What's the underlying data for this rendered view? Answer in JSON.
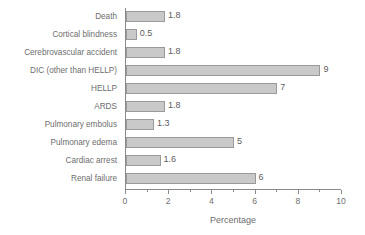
{
  "chart_data": {
    "type": "bar",
    "orientation": "horizontal",
    "title": "",
    "xlabel": "Percentage",
    "ylabel": "",
    "xlim": [
      0,
      10
    ],
    "xticks": [
      0,
      2,
      4,
      6,
      8,
      10
    ],
    "xtick_labels": [
      "0",
      "2",
      "4",
      "6",
      "8",
      "10"
    ],
    "grid": false,
    "legend": null,
    "categories": [
      "Death",
      "Cortical blindness",
      "Cerebrovascular accident",
      "DIC (other than HELLP)",
      "HELLP",
      "ARDS",
      "Pulmonary embolus",
      "Pulmonary edema",
      "Cardiac arrest",
      "Renal failure"
    ],
    "values": [
      1.8,
      0.5,
      1.8,
      9,
      7,
      1.8,
      1.3,
      5,
      1.6,
      6
    ],
    "value_labels": [
      "1.8",
      "0.5",
      "1.8",
      "9",
      "7",
      "1.8",
      "1.3",
      "5",
      "1.6",
      "6"
    ],
    "bar_color": "#c9c9c9",
    "bar_border_color": "#9a9a9a",
    "axis_color": "#8a8a8a",
    "text_color": "#6e6e6e",
    "background": "#ffffff"
  }
}
